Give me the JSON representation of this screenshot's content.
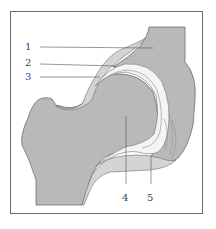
{
  "diagram": {
    "type": "anatomical-illustration",
    "colors": {
      "bone": "#b9b9b9",
      "cartilage": "#d4d4d4",
      "joint_space": "#f4f4f4",
      "outline": "#6f6f6f",
      "leader": "#555555",
      "frame": "#6a6a6a"
    },
    "labels": [
      {
        "id": "1",
        "text": "1"
      },
      {
        "id": "2",
        "text": "2"
      },
      {
        "id": "3",
        "text": "3"
      },
      {
        "id": "4",
        "text": "4"
      },
      {
        "id": "5",
        "text": "5"
      }
    ]
  }
}
